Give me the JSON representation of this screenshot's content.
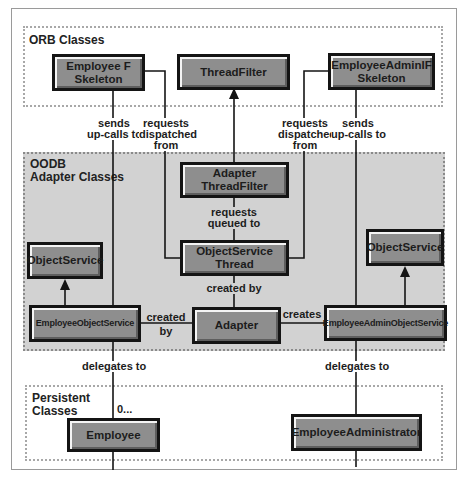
{
  "regions": {
    "orb": {
      "label": "ORB Classes"
    },
    "oodb": {
      "label_line1": "OODB",
      "label_line2": "Adapter Classes"
    },
    "persistent": {
      "label_line1": "Persistent",
      "label_line2": "Classes"
    }
  },
  "classes": {
    "employee_f_skeleton": {
      "line1": "Employee F",
      "line2": "Skeleton"
    },
    "thread_filter": {
      "label": "ThreadFilter"
    },
    "employee_admin_if_skeleton": {
      "line1": "EmployeeAdminIF",
      "line2": "Skeleton"
    },
    "adapter_thread_filter": {
      "label": "Adapter ThreadFilter"
    },
    "object_service_thread": {
      "label": "ObjectService Thread"
    },
    "object_service_left": {
      "label": "ObjectService"
    },
    "object_service_right": {
      "label": "ObjectService"
    },
    "employee_object_service": {
      "label": "EmployeeObjectService"
    },
    "adapter": {
      "label": "Adapter"
    },
    "employee_admin_object_service": {
      "label": "EmployeeAdminObjectService"
    },
    "employee": {
      "label": "Employee"
    },
    "employee_administrator": {
      "label": "EmployeeAdministrator"
    }
  },
  "relations": {
    "sends_upcalls_left": {
      "line1": "sends",
      "line2": "up-calls to"
    },
    "requests_dispatched_left": {
      "line1": "requests",
      "line2": "dispatched",
      "line3": "from"
    },
    "requests_dispatched_right": {
      "line1": "requests",
      "line2": "dispatched",
      "line3": "from"
    },
    "sends_upcalls_right": {
      "line1": "sends",
      "line2": "up-calls to"
    },
    "requests_queued": {
      "line1": "requests",
      "line2": "queued to"
    },
    "created_by_thread": {
      "label": "created by"
    },
    "created_by_eos": {
      "line1": "created",
      "line2": "by"
    },
    "creates": {
      "label": "creates"
    },
    "delegates_left": {
      "label": "delegates to"
    },
    "delegates_right": {
      "label": "delegates to"
    },
    "multiplicity": {
      "label": "0..."
    }
  },
  "colors": {
    "box_fill": "#8e8e8e",
    "box_border": "#141414",
    "oodb_fill": "#d2d2d2",
    "line": "#141414"
  }
}
